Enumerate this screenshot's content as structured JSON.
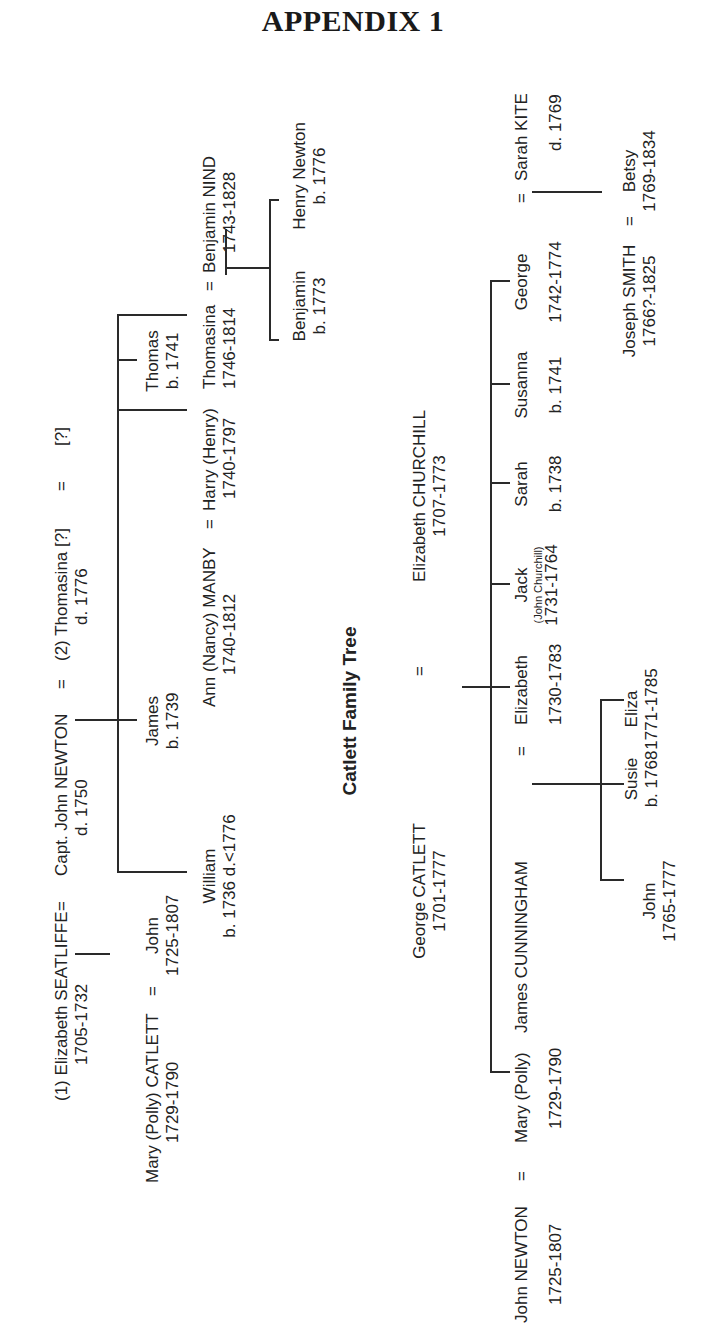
{
  "title": "APPENDIX 1",
  "newton_tree": {
    "elizabeth_seatliffe": {
      "label": "(1)  Elizabeth SEATLIFFE",
      "dates": "1705-1732"
    },
    "capt_john_newton": {
      "label": "Capt. John NEWTON",
      "dates": "d. 1750"
    },
    "thomasina_wife": {
      "label": "(2)  Thomasina [?]",
      "dates": "d. 1776"
    },
    "unknown_spouse": {
      "label": "[?]"
    },
    "eq": "=",
    "mary_polly_catlett": {
      "label": "Mary (Polly) CATLETT",
      "dates": "1729-1790"
    },
    "john": {
      "label": "John",
      "dates": "1725-1807"
    },
    "james": {
      "label": "James",
      "dates": "b. 1739"
    },
    "william": {
      "label": "William",
      "dates": "b. 1736  d.<1776"
    },
    "ann_manby": {
      "label": "Ann (Nancy) MANBY",
      "dates": "1740-1812"
    },
    "harry": {
      "label": "Harry (Henry)",
      "dates": "1740-1797"
    },
    "thomas": {
      "label": "Thomas",
      "dates": "b. 1741"
    },
    "thomasina": {
      "label": "Thomasina",
      "dates": "1746-1814"
    },
    "benjamin_nind": {
      "label": "Benjamin NIND",
      "dates": "1743-1828"
    },
    "benjamin": {
      "label": "Benjamin",
      "dates": "b. 1773"
    },
    "henry_newton": {
      "label": "Henry Newton",
      "dates": "b. 1776"
    }
  },
  "catlett_tree": {
    "heading": "Catlett Family Tree",
    "george_catlett": {
      "label": "George CATLETT",
      "dates": "1701-1777"
    },
    "elizabeth_churchill": {
      "label": "Elizabeth CHURCHILL",
      "dates": "1707-1773"
    },
    "john_newton": {
      "label": "John NEWTON",
      "dates": "1725-1807"
    },
    "mary_polly": {
      "label": "Mary (Polly)",
      "dates": "1729-1790"
    },
    "james_cunningham": {
      "label": "James CUNNINGHAM"
    },
    "elizabeth": {
      "label": "Elizabeth",
      "dates": "1730-1783"
    },
    "jack": {
      "label": "Jack",
      "note": "(John Churchill)",
      "dates": "1731-1764"
    },
    "sarah": {
      "label": "Sarah",
      "dates": "b. 1738"
    },
    "susanna": {
      "label": "Susanna",
      "dates": "b. 1741"
    },
    "george": {
      "label": "George",
      "dates": "1742-1774"
    },
    "sarah_kite": {
      "label": "Sarah KITE",
      "dates": "d. 1769"
    },
    "john_c": {
      "label": "John",
      "dates": "1765-1777"
    },
    "susie": {
      "label": "Susie",
      "dates": "b. 1768"
    },
    "eliza": {
      "label": "Eliza",
      "dates": "1771-1785"
    },
    "joseph_smith": {
      "label": "Joseph SMITH",
      "dates": "1766?-1825"
    },
    "betsy": {
      "label": "Betsy",
      "dates": "1769-1834"
    }
  }
}
